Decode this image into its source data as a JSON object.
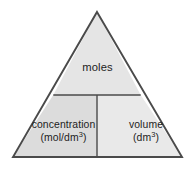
{
  "diagram": {
    "shape": "triangle",
    "outline_color": "#4a4a4a",
    "background_color": "#ffffff",
    "cells": {
      "top": {
        "label": "moles",
        "fill_color": "#e5e5e5"
      },
      "bottom_left": {
        "label": "concentration",
        "unit_base": "(mol/dm",
        "unit_exponent": "3",
        "unit_close": ")",
        "fill_color": "#dcdcdc"
      },
      "bottom_right": {
        "label": "volume",
        "unit_base": "(dm",
        "unit_exponent": "3",
        "unit_close": ")",
        "fill_color": "#e9e9e9"
      }
    }
  }
}
